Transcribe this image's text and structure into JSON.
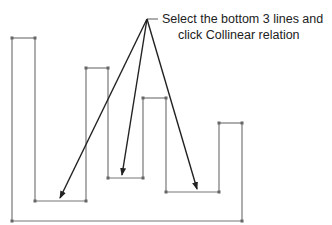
{
  "callout": {
    "line1": "Select the bottom 3 lines and",
    "line2": "click Collinear relation"
  },
  "colors": {
    "sketch_line": "#777777",
    "leader_line": "#222222",
    "text": "#222222",
    "background": "#ffffff"
  },
  "sketch": {
    "profile_points": [
      [
        12,
        38
      ],
      [
        35,
        38
      ],
      [
        35,
        201
      ],
      [
        86,
        201
      ],
      [
        86,
        68
      ],
      [
        108,
        68
      ],
      [
        108,
        178
      ],
      [
        143,
        178
      ],
      [
        143,
        98
      ],
      [
        166,
        98
      ],
      [
        166,
        192
      ],
      [
        219,
        192
      ],
      [
        219,
        123
      ],
      [
        242,
        123
      ],
      [
        242,
        221
      ],
      [
        12,
        221
      ]
    ],
    "target_lines": [
      "bottom-line-1",
      "bottom-line-2",
      "bottom-line-3"
    ]
  },
  "leaders": {
    "apex": [
      147,
      19
    ],
    "tail_end": [
      158,
      19
    ],
    "arrow_tips": [
      [
        60,
        198
      ],
      [
        122,
        175
      ],
      [
        197,
        189
      ]
    ]
  }
}
